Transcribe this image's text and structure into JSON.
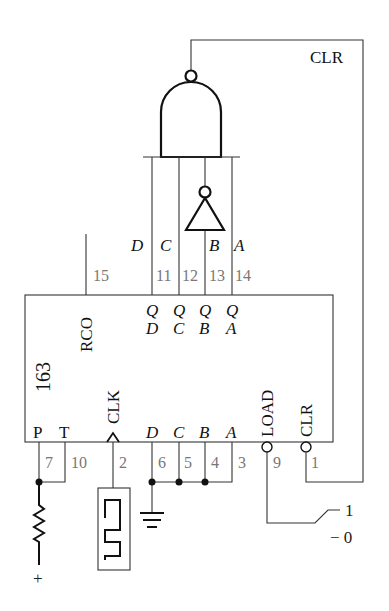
{
  "diagram": {
    "chip": {
      "part_number": "163",
      "top_outputs": {
        "rco": "RCO",
        "qd": {
          "q": "Q",
          "sub": "D"
        },
        "qc": {
          "q": "Q",
          "sub": "C"
        },
        "qb": {
          "q": "Q",
          "sub": "B"
        },
        "qa": {
          "q": "Q",
          "sub": "A"
        }
      },
      "bottom_inputs": {
        "p": "P",
        "t": "T",
        "clk": "CLK",
        "d": "D",
        "c": "C",
        "b": "B",
        "a": "A",
        "load": "LOAD",
        "clr": "CLR"
      },
      "pin_numbers": {
        "rco": "15",
        "qd": "11",
        "qc": "12",
        "qb": "13",
        "qa": "14",
        "p": "7",
        "t": "10",
        "clk": "2",
        "d": "6",
        "c": "5",
        "b": "4",
        "a": "3",
        "load": "9",
        "clr": "1"
      }
    },
    "output_labels": {
      "d": "D",
      "c": "C",
      "b": "B",
      "a": "A"
    },
    "feedback_label": "CLR",
    "switch": {
      "high": "1",
      "low": "− 0"
    },
    "supply": "+",
    "components": [
      "nand-gate",
      "inverter",
      "resistor",
      "clock-source",
      "ground",
      "spdt-switch"
    ]
  }
}
